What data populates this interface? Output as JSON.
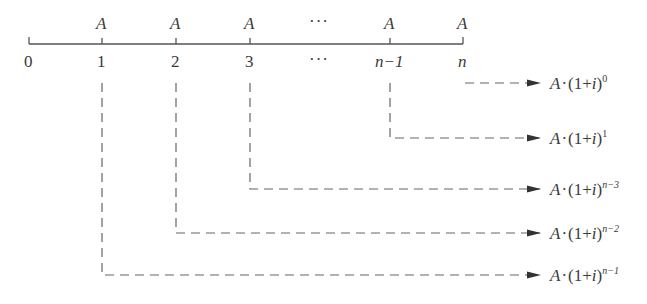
{
  "diagram": {
    "type": "cash-flow-timeline",
    "payment_label": "A",
    "timeline": {
      "periods": [
        {
          "label": "0",
          "x": 29,
          "payment": false
        },
        {
          "label": "1",
          "x": 102,
          "payment": true
        },
        {
          "label": "2",
          "x": 176,
          "payment": true
        },
        {
          "label": "3",
          "x": 250,
          "payment": true
        },
        {
          "label": "···",
          "x": 320,
          "payment": "ellipsis"
        },
        {
          "label": "n−1",
          "x": 390,
          "payment": true
        },
        {
          "label": "n",
          "x": 463,
          "payment": true
        }
      ]
    },
    "ellipsis": "···",
    "flows": [
      {
        "from": "n",
        "base": "A",
        "dot": "·",
        "paren": "(1+",
        "var": "i",
        "close": ")",
        "exponent": "0",
        "y": 83
      },
      {
        "from": "n−1",
        "base": "A",
        "dot": "·",
        "paren": "(1+",
        "var": "i",
        "close": ")",
        "exponent": "1",
        "y": 138
      },
      {
        "from": "3",
        "base": "A",
        "dot": "·",
        "paren": "(1+",
        "var": "i",
        "close": ")",
        "exponent": "n−3",
        "y": 189
      },
      {
        "from": "2",
        "base": "A",
        "dot": "·",
        "paren": "(1+",
        "var": "i",
        "close": ")",
        "exponent": "n−2",
        "y": 233
      },
      {
        "from": "1",
        "base": "A",
        "dot": "·",
        "paren": "(1+",
        "var": "i",
        "close": ")",
        "exponent": "n−1",
        "y": 275
      }
    ],
    "colors": {
      "line": "#555555",
      "dash": "#666666",
      "arrow": "#333333",
      "text": "#3a3a3a"
    }
  }
}
